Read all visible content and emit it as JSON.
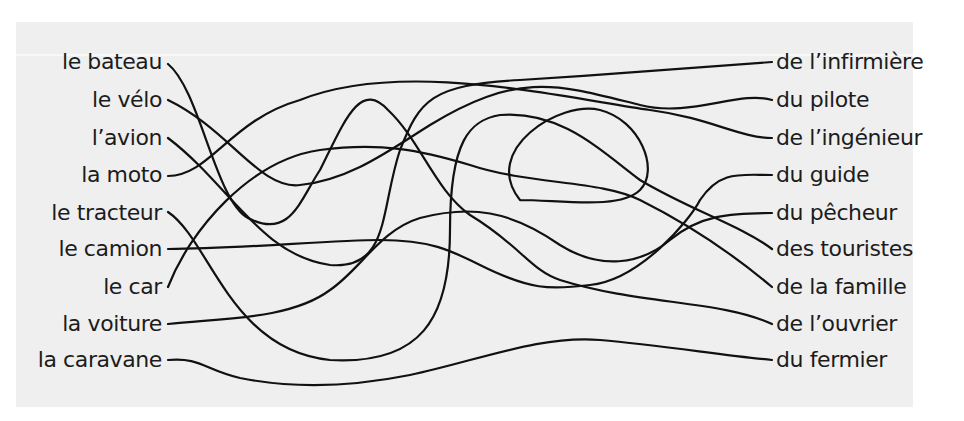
{
  "diagram": {
    "type": "tangled-lines matching exercise",
    "left_items": [
      {
        "label": "le bateau",
        "y": 62
      },
      {
        "label": "le vélo",
        "y": 100
      },
      {
        "label": "l’avion",
        "y": 138
      },
      {
        "label": "la moto",
        "y": 175
      },
      {
        "label": "le tracteur",
        "y": 213
      },
      {
        "label": "le camion",
        "y": 249
      },
      {
        "label": "le car",
        "y": 287
      },
      {
        "label": "la voiture",
        "y": 324
      },
      {
        "label": "la caravane",
        "y": 360
      }
    ],
    "right_items": [
      {
        "label": "de l’infirmière",
        "y": 62
      },
      {
        "label": "du pilote",
        "y": 100
      },
      {
        "label": "de l’ingénieur",
        "y": 138
      },
      {
        "label": "du guide",
        "y": 175
      },
      {
        "label": "du pêcheur",
        "y": 213
      },
      {
        "label": "des touristes",
        "y": 249
      },
      {
        "label": "de la famille",
        "y": 287
      },
      {
        "label": "de l’ouvrier",
        "y": 324
      },
      {
        "label": "du fermier",
        "y": 360
      }
    ],
    "wires": [
      {
        "name": "wire-le-bateau",
        "d": "M168,64 C200,90 215,200 248,218 C290,240 300,200 320,170 C345,120 360,80 388,110 C420,140 435,190 470,215 C520,245 530,270 560,280 C640,305 720,300 772,324"
      },
      {
        "name": "wire-le-velo",
        "d": "M168,100 C230,130 260,190 300,185 C350,180 390,150 430,125 C520,70 560,85 640,105 C690,118 740,90 772,100"
      },
      {
        "name": "wire-l-avion",
        "d": "M168,138 C230,185 260,255 330,265 C390,270 380,210 400,150 C420,100 430,85 520,80 C600,75 660,70 772,62"
      },
      {
        "name": "wire-la-moto",
        "d": "M168,176 C210,176 230,120 300,100 C400,60 550,95 650,110 C710,118 740,138 772,138"
      },
      {
        "name": "wire-le-tracteur",
        "d": "M168,212 C210,240 230,350 330,360 C420,365 450,320 450,230 C450,140 470,120 500,115 C560,110 600,150 640,180 C690,210 740,225 772,249"
      },
      {
        "name": "wire-le-camion",
        "d": "M168,249 C240,249 330,240 380,240 C430,240 450,250 480,265 C530,290 550,290 590,285 C640,280 690,220 700,200 C720,170 740,175 772,175"
      },
      {
        "name": "wire-le-car",
        "d": "M168,287 C190,230 250,160 320,150 C380,142 420,150 470,165 C530,185 600,180 640,200 C700,230 740,260 772,287"
      },
      {
        "name": "wire-la-voiture",
        "d": "M168,324 C220,318 290,320 330,290 C360,270 380,230 420,218 C470,205 510,210 560,245 C600,270 640,265 670,240 C700,215 730,213 772,213"
      },
      {
        "name": "wire-la-caravane",
        "d": "M168,360 C200,357 205,370 240,378 C300,390 360,385 410,375 C480,360 540,335 600,340 C660,345 720,355 772,360"
      },
      {
        "name": "wire-loop",
        "d": "M520,200 C480,150 560,100 600,110 C640,120 660,170 640,190 C620,210 560,200 520,200"
      }
    ]
  }
}
